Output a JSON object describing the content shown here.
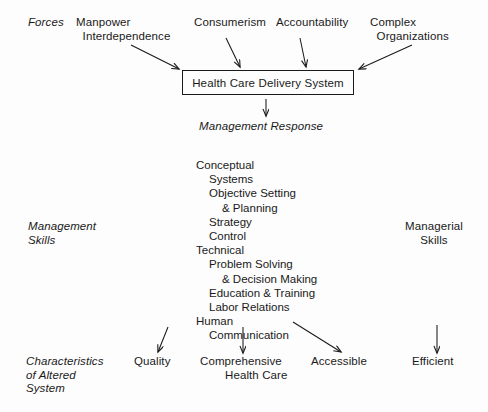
{
  "diagram": {
    "row_labels": {
      "forces": "Forces",
      "management_skills": "Management\nSkills",
      "managerial_skills": "Managerial\nSkills",
      "characteristics": "Characteristics\nof Altered\nSystem"
    },
    "forces": [
      {
        "label": "Manpower\n  Interdependence",
        "name": "force-manpower-interdependence"
      },
      {
        "label": "Consumerism",
        "name": "force-consumerism"
      },
      {
        "label": "Accountability",
        "name": "force-accountability"
      },
      {
        "label": "Complex\n  Organizations",
        "name": "force-complex-organizations"
      }
    ],
    "central_node": "Health Care Delivery System",
    "response_label": "Management Response",
    "skills": [
      {
        "text": "Conceptual",
        "indent": 0
      },
      {
        "text": "Systems",
        "indent": 1
      },
      {
        "text": "Objective Setting",
        "indent": 1
      },
      {
        "text": "& Planning",
        "indent": 2
      },
      {
        "text": "Strategy",
        "indent": 1
      },
      {
        "text": "Control",
        "indent": 1
      },
      {
        "text": "Technical",
        "indent": 0
      },
      {
        "text": "Problem Solving",
        "indent": 1
      },
      {
        "text": "& Decision Making",
        "indent": 2
      },
      {
        "text": "Education & Training",
        "indent": 1
      },
      {
        "text": "Labor Relations",
        "indent": 1
      },
      {
        "text": "Human",
        "indent": 0
      },
      {
        "text": "Communication",
        "indent": 1
      }
    ],
    "outcomes": [
      {
        "label": "Quality",
        "name": "outcome-quality"
      },
      {
        "label": "Comprehensive",
        "name": "outcome-comprehensive"
      },
      {
        "label": "Health Care",
        "name": "outcome-health-care"
      },
      {
        "label": "Accessible",
        "name": "outcome-accessible"
      },
      {
        "label": "Efficient",
        "name": "outcome-efficient"
      }
    ],
    "colors": {
      "background": "#fdfdfd",
      "ink": "#1a1a1a"
    }
  }
}
